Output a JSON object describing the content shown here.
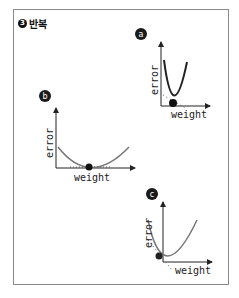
{
  "header": {
    "step_number": "3",
    "title": "반복"
  },
  "colors": {
    "curve": "#6e6e6e",
    "axis": "#222222",
    "point": "#111111",
    "frame": "#8a8a8a"
  },
  "panels": [
    {
      "id": "a",
      "badge": "a",
      "x_label": "weight",
      "y_label": "error",
      "curve": "narrow parabola",
      "point_position": "near minimum, left side"
    },
    {
      "id": "b",
      "badge": "b",
      "x_label": "weight",
      "y_label": "error",
      "curve": "wide parabola",
      "point_position": "at minimum"
    },
    {
      "id": "c",
      "badge": "c",
      "x_label": "weight",
      "y_label": "error",
      "curve": "narrow parabola",
      "point_position": "left slope, above minimum"
    }
  ]
}
